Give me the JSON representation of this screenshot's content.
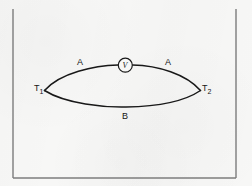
{
  "figure": {
    "type": "thermocouple-circuit-diagram",
    "frame": {
      "style": "rectangular border, top edge not visible",
      "color": "#7c7c7c"
    },
    "background_color": "#f7f7f6",
    "line_color": "#181818",
    "labels": {
      "conductor_upper_left": "A",
      "conductor_upper_right": "A",
      "conductor_lower": "B",
      "junction_left": "T",
      "junction_left_sub": "1",
      "junction_right": "T",
      "junction_right_sub": "2",
      "meter": "V"
    },
    "elements": [
      {
        "name": "upper-conductor-arc",
        "label": "A",
        "description": "upper lens arc from left junction to right junction, interrupted by voltmeter"
      },
      {
        "name": "lower-conductor-arc",
        "label": "B",
        "description": "lower lens arc from left junction to right junction"
      },
      {
        "name": "voltmeter",
        "label": "V",
        "description": "circle symbol inserted in upper conductor at apex"
      },
      {
        "name": "junction-left",
        "label": "T1",
        "description": "left vertex of lens, measuring junction"
      },
      {
        "name": "junction-right",
        "label": "T2",
        "description": "right vertex of lens, reference junction"
      }
    ]
  }
}
